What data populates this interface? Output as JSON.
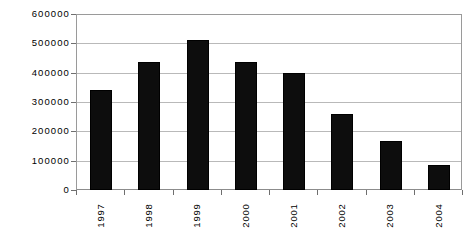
{
  "chart_data": {
    "type": "bar",
    "title": "",
    "subtitle": "",
    "xlabel": "",
    "ylabel": "",
    "categories": [
      "1997",
      "1998",
      "1999",
      "2000",
      "2001",
      "2002",
      "2003",
      "2004"
    ],
    "values": [
      340000,
      435000,
      511000,
      435000,
      400000,
      258000,
      168000,
      85000
    ],
    "series": [
      {
        "name": "",
        "values": [
          340000,
          435000,
          511000,
          435000,
          400000,
          258000,
          168000,
          85000
        ]
      }
    ],
    "ylim": [
      0,
      600000
    ],
    "yticks": [
      0,
      100000,
      200000,
      300000,
      400000,
      500000,
      600000
    ],
    "ytick_labels": [
      "0",
      "100000",
      "200000",
      "300000",
      "400000",
      "500000",
      "600000"
    ],
    "grid": true,
    "grid_axis": "y",
    "legend": false,
    "legend_position": "none",
    "bar_color": "#0d0d0d",
    "grid_color": "#b9b9b9",
    "axis_color": "#9a9a9a",
    "background_color": "#ffffff",
    "xtick_label_rotation": 90,
    "annotations": []
  }
}
